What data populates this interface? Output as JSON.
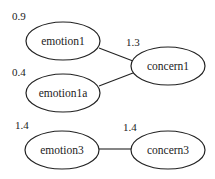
{
  "diagram": {
    "type": "graph",
    "nodes": [
      {
        "id": "emotion1",
        "label": "emotion1",
        "weight": "0.9"
      },
      {
        "id": "emotion1a",
        "label": "emotion1a",
        "weight": "0.4"
      },
      {
        "id": "concern1",
        "label": "concern1",
        "weight": "1.3"
      },
      {
        "id": "emotion3",
        "label": "emotion3",
        "weight": "1.4"
      },
      {
        "id": "concern3",
        "label": "concern3",
        "weight": "1.4"
      }
    ],
    "edges": [
      {
        "from": "emotion1",
        "to": "concern1"
      },
      {
        "from": "emotion1a",
        "to": "concern1"
      },
      {
        "from": "emotion3",
        "to": "concern3"
      }
    ]
  }
}
